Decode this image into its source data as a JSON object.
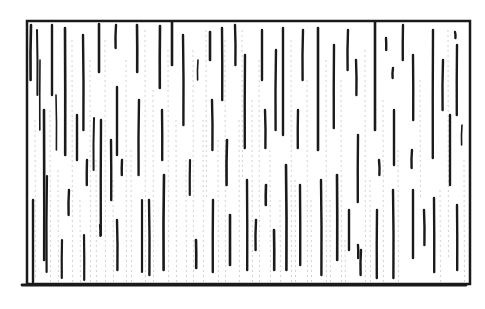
{
  "illustration": {
    "title": "Hatched rectangle sketch",
    "background": "#ffffff",
    "ink": "#1a1a1a",
    "faint_ink": "#8a8a8a",
    "frame": {
      "x": 27,
      "y": 21,
      "width": 443,
      "height": 263,
      "stroke_width": 2.5
    },
    "bottom_line": {
      "x1": 22,
      "x2": 466,
      "y": 285
    },
    "strokes": [
      {
        "x": 31,
        "y1": 25,
        "y2": 80,
        "w": 2.6
      },
      {
        "x": 33,
        "y1": 200,
        "y2": 282,
        "w": 2.4
      },
      {
        "x": 37,
        "y1": 30,
        "y2": 95,
        "w": 2
      },
      {
        "x": 40,
        "y1": 60,
        "y2": 130,
        "w": 1.6
      },
      {
        "x": 44,
        "y1": 110,
        "y2": 260,
        "w": 2.6
      },
      {
        "x": 47,
        "y1": 176,
        "y2": 272,
        "w": 2.2
      },
      {
        "x": 52,
        "y1": 25,
        "y2": 95,
        "w": 2.4
      },
      {
        "x": 56,
        "y1": 95,
        "y2": 150,
        "w": 1.6
      },
      {
        "x": 62,
        "y1": 240,
        "y2": 278,
        "w": 2.2
      },
      {
        "x": 65,
        "y1": 28,
        "y2": 155,
        "w": 2.6
      },
      {
        "x": 69,
        "y1": 190,
        "y2": 215,
        "w": 2.4
      },
      {
        "x": 77,
        "y1": 115,
        "y2": 160,
        "w": 2.4
      },
      {
        "x": 83,
        "y1": 35,
        "y2": 130,
        "w": 2.4
      },
      {
        "x": 87,
        "y1": 160,
        "y2": 185,
        "w": 2.4
      },
      {
        "x": 84,
        "y1": 235,
        "y2": 280,
        "w": 2.2
      },
      {
        "x": 94,
        "y1": 118,
        "y2": 170,
        "w": 2
      },
      {
        "x": 99,
        "y1": 24,
        "y2": 72,
        "w": 2.6
      },
      {
        "x": 100,
        "y1": 225,
        "y2": 236,
        "w": 2.2
      },
      {
        "x": 101,
        "y1": 120,
        "y2": 235,
        "w": 2.4
      },
      {
        "x": 111,
        "y1": 140,
        "y2": 200,
        "w": 2.4
      },
      {
        "x": 116,
        "y1": 25,
        "y2": 48,
        "w": 2.4
      },
      {
        "x": 117,
        "y1": 87,
        "y2": 155,
        "w": 2.4
      },
      {
        "x": 117,
        "y1": 220,
        "y2": 270,
        "w": 2.4
      },
      {
        "x": 122,
        "y1": 160,
        "y2": 175,
        "w": 2.4
      },
      {
        "x": 137,
        "y1": 25,
        "y2": 72,
        "w": 2.6
      },
      {
        "x": 139,
        "y1": 100,
        "y2": 175,
        "w": 2.4
      },
      {
        "x": 142,
        "y1": 200,
        "y2": 272,
        "w": 2.2
      },
      {
        "x": 149,
        "y1": 200,
        "y2": 275,
        "w": 2.4
      },
      {
        "x": 160,
        "y1": 26,
        "y2": 88,
        "w": 2.6
      },
      {
        "x": 162,
        "y1": 110,
        "y2": 160,
        "w": 2.4
      },
      {
        "x": 164,
        "y1": 175,
        "y2": 270,
        "w": 2.6
      },
      {
        "x": 172,
        "y1": 22,
        "y2": 65,
        "w": 2.6
      },
      {
        "x": 183,
        "y1": 35,
        "y2": 125,
        "w": 2.4
      },
      {
        "x": 190,
        "y1": 160,
        "y2": 195,
        "w": 2.2
      },
      {
        "x": 196,
        "y1": 240,
        "y2": 268,
        "w": 2.6
      },
      {
        "x": 198,
        "y1": 60,
        "y2": 80,
        "w": 1.6
      },
      {
        "x": 210,
        "y1": 32,
        "y2": 60,
        "w": 2.6
      },
      {
        "x": 212,
        "y1": 100,
        "y2": 150,
        "w": 2.4
      },
      {
        "x": 213,
        "y1": 200,
        "y2": 272,
        "w": 2.4
      },
      {
        "x": 222,
        "y1": 28,
        "y2": 100,
        "w": 2.4
      },
      {
        "x": 227,
        "y1": 140,
        "y2": 185,
        "w": 2.6
      },
      {
        "x": 230,
        "y1": 215,
        "y2": 265,
        "w": 2.6
      },
      {
        "x": 235,
        "y1": 25,
        "y2": 65,
        "w": 2.4
      },
      {
        "x": 245,
        "y1": 55,
        "y2": 148,
        "w": 2.4
      },
      {
        "x": 247,
        "y1": 180,
        "y2": 270,
        "w": 2.4
      },
      {
        "x": 256,
        "y1": 220,
        "y2": 250,
        "w": 2.4
      },
      {
        "x": 262,
        "y1": 30,
        "y2": 80,
        "w": 2.4
      },
      {
        "x": 265,
        "y1": 110,
        "y2": 148,
        "w": 2.4
      },
      {
        "x": 266,
        "y1": 185,
        "y2": 205,
        "w": 2.6
      },
      {
        "x": 274,
        "y1": 230,
        "y2": 270,
        "w": 2.6
      },
      {
        "x": 276,
        "y1": 50,
        "y2": 130,
        "w": 2.4
      },
      {
        "x": 283,
        "y1": 28,
        "y2": 135,
        "w": 2.4
      },
      {
        "x": 286,
        "y1": 165,
        "y2": 270,
        "w": 2.6
      },
      {
        "x": 298,
        "y1": 110,
        "y2": 148,
        "w": 2.4
      },
      {
        "x": 300,
        "y1": 185,
        "y2": 265,
        "w": 2.4
      },
      {
        "x": 303,
        "y1": 30,
        "y2": 80,
        "w": 2.4
      },
      {
        "x": 318,
        "y1": 28,
        "y2": 150,
        "w": 2.6
      },
      {
        "x": 321,
        "y1": 180,
        "y2": 275,
        "w": 2.4
      },
      {
        "x": 334,
        "y1": 45,
        "y2": 128,
        "w": 2.4
      },
      {
        "x": 337,
        "y1": 175,
        "y2": 260,
        "w": 2.6
      },
      {
        "x": 348,
        "y1": 30,
        "y2": 70,
        "w": 2.4
      },
      {
        "x": 349,
        "y1": 210,
        "y2": 250,
        "w": 2.4
      },
      {
        "x": 356,
        "y1": 60,
        "y2": 95,
        "w": 2.4
      },
      {
        "x": 358,
        "y1": 135,
        "y2": 202,
        "w": 2.4
      },
      {
        "x": 358,
        "y1": 245,
        "y2": 258,
        "w": 2.4
      },
      {
        "x": 361,
        "y1": 250,
        "y2": 275,
        "w": 2.4
      },
      {
        "x": 375,
        "y1": 22,
        "y2": 130,
        "w": 2.6
      },
      {
        "x": 379,
        "y1": 160,
        "y2": 175,
        "w": 2.4
      },
      {
        "x": 377,
        "y1": 210,
        "y2": 278,
        "w": 2.4
      },
      {
        "x": 386,
        "y1": 38,
        "y2": 50,
        "w": 2.4
      },
      {
        "x": 393,
        "y1": 68,
        "y2": 78,
        "w": 2.4
      },
      {
        "x": 394,
        "y1": 110,
        "y2": 165,
        "w": 2.4
      },
      {
        "x": 393,
        "y1": 190,
        "y2": 278,
        "w": 2.4
      },
      {
        "x": 403,
        "y1": 25,
        "y2": 60,
        "w": 2.4
      },
      {
        "x": 413,
        "y1": 55,
        "y2": 120,
        "w": 2.4
      },
      {
        "x": 412,
        "y1": 150,
        "y2": 168,
        "w": 2.4
      },
      {
        "x": 413,
        "y1": 190,
        "y2": 258,
        "w": 2.4
      },
      {
        "x": 424,
        "y1": 210,
        "y2": 245,
        "w": 2.4
      },
      {
        "x": 433,
        "y1": 30,
        "y2": 158,
        "w": 2.4
      },
      {
        "x": 434,
        "y1": 198,
        "y2": 272,
        "w": 2.4
      },
      {
        "x": 443,
        "y1": 60,
        "y2": 110,
        "w": 2.4
      },
      {
        "x": 450,
        "y1": 115,
        "y2": 185,
        "w": 2.4
      },
      {
        "x": 455,
        "y1": 32,
        "y2": 38,
        "w": 2.4
      },
      {
        "x": 457,
        "y1": 45,
        "y2": 115,
        "w": 2.4
      },
      {
        "x": 457,
        "y1": 205,
        "y2": 270,
        "w": 2.4
      },
      {
        "x": 462,
        "y1": 125,
        "y2": 145,
        "w": 1.6
      }
    ],
    "faint_strokes": [
      {
        "x": 35,
        "y1": 120,
        "y2": 280
      },
      {
        "x": 50,
        "y1": 110,
        "y2": 282
      },
      {
        "x": 58,
        "y1": 170,
        "y2": 282
      },
      {
        "x": 72,
        "y1": 40,
        "y2": 282
      },
      {
        "x": 80,
        "y1": 200,
        "y2": 282
      },
      {
        "x": 90,
        "y1": 60,
        "y2": 282
      },
      {
        "x": 96,
        "y1": 160,
        "y2": 282
      },
      {
        "x": 105,
        "y1": 40,
        "y2": 282
      },
      {
        "x": 113,
        "y1": 180,
        "y2": 282
      },
      {
        "x": 126,
        "y1": 60,
        "y2": 282
      },
      {
        "x": 131,
        "y1": 150,
        "y2": 282
      },
      {
        "x": 145,
        "y1": 30,
        "y2": 282
      },
      {
        "x": 153,
        "y1": 90,
        "y2": 282
      },
      {
        "x": 168,
        "y1": 50,
        "y2": 282
      },
      {
        "x": 176,
        "y1": 120,
        "y2": 282
      },
      {
        "x": 186,
        "y1": 160,
        "y2": 282
      },
      {
        "x": 193,
        "y1": 50,
        "y2": 282
      },
      {
        "x": 203,
        "y1": 120,
        "y2": 282
      },
      {
        "x": 206,
        "y1": 30,
        "y2": 200
      },
      {
        "x": 218,
        "y1": 140,
        "y2": 282
      },
      {
        "x": 225,
        "y1": 40,
        "y2": 282
      },
      {
        "x": 239,
        "y1": 120,
        "y2": 282
      },
      {
        "x": 242,
        "y1": 30,
        "y2": 180
      },
      {
        "x": 252,
        "y1": 100,
        "y2": 282
      },
      {
        "x": 259,
        "y1": 60,
        "y2": 282
      },
      {
        "x": 270,
        "y1": 150,
        "y2": 282
      },
      {
        "x": 280,
        "y1": 200,
        "y2": 282
      },
      {
        "x": 291,
        "y1": 40,
        "y2": 282
      },
      {
        "x": 295,
        "y1": 180,
        "y2": 282
      },
      {
        "x": 307,
        "y1": 80,
        "y2": 282
      },
      {
        "x": 311,
        "y1": 200,
        "y2": 282
      },
      {
        "x": 326,
        "y1": 60,
        "y2": 282
      },
      {
        "x": 330,
        "y1": 200,
        "y2": 282
      },
      {
        "x": 341,
        "y1": 80,
        "y2": 282
      },
      {
        "x": 345,
        "y1": 240,
        "y2": 282
      },
      {
        "x": 365,
        "y1": 50,
        "y2": 282
      },
      {
        "x": 370,
        "y1": 180,
        "y2": 282
      },
      {
        "x": 383,
        "y1": 100,
        "y2": 282
      },
      {
        "x": 398,
        "y1": 150,
        "y2": 282
      },
      {
        "x": 420,
        "y1": 80,
        "y2": 200
      },
      {
        "x": 440,
        "y1": 190,
        "y2": 282
      },
      {
        "x": 448,
        "y1": 30,
        "y2": 260
      },
      {
        "x": 464,
        "y1": 160,
        "y2": 282
      }
    ]
  }
}
